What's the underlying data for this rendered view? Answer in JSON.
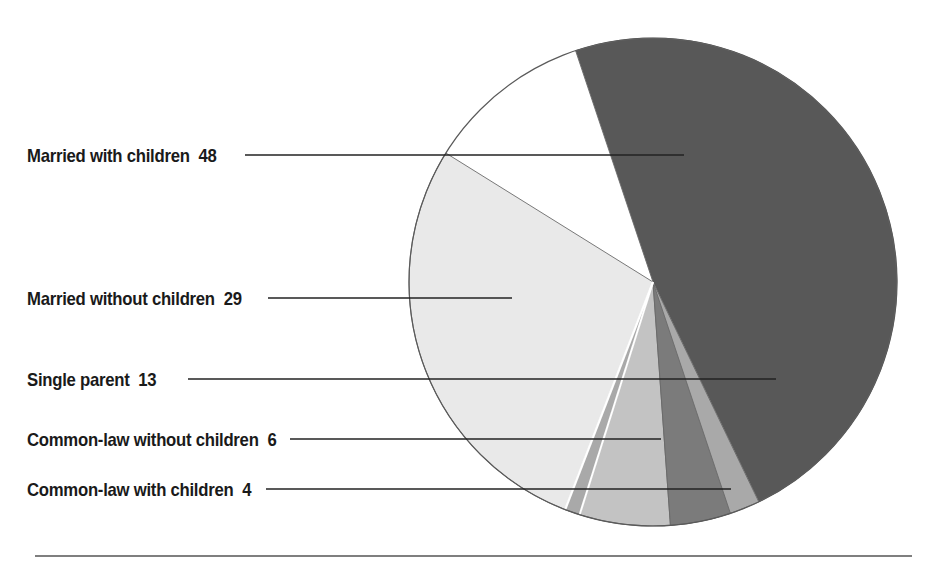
{
  "chart_data": {
    "type": "pie",
    "title": "",
    "subtitle": "",
    "xlabel": "",
    "ylabel": "",
    "legend_position": "left-callout-labels",
    "grid": false,
    "units": "percent",
    "total": 100,
    "categories": [
      "Married with children",
      "Married without children",
      "Single parent",
      "Common-law without children",
      "Common-law with children"
    ],
    "values": [
      48,
      29,
      13,
      6,
      4
    ],
    "slices": [
      {
        "label": "Married with children",
        "value": 48,
        "value_text": "48",
        "color": "#585858",
        "start_angle": 341.5,
        "sweep": 172.8
      },
      {
        "label": "Married without children",
        "value": 29,
        "value_text": "29",
        "color": "#e9e9e9",
        "start_angle": 197.5,
        "sweep": 104.4
      },
      {
        "label": "Single parent",
        "value": 13,
        "value_text": "13",
        "color": "#a9a9a9",
        "start_angle": 154.3,
        "sweep": 46.8
      },
      {
        "label": "Common-law without children",
        "value": 6,
        "value_text": "6",
        "color": "#c3c3c3",
        "start_angle": 175.9,
        "sweep": 21.6
      },
      {
        "label": "Common-law with children",
        "value": 4,
        "value_text": "4",
        "color": "#7b7b7b",
        "start_angle": 161.5,
        "sweep": 14.4
      }
    ]
  },
  "labels": [
    {
      "text": "Married with children",
      "value": "48"
    },
    {
      "text": "Married without children",
      "value": "29"
    },
    {
      "text": "Single parent",
      "value": "13"
    },
    {
      "text": "Common-law without children",
      "value": "6"
    },
    {
      "text": "Common-law with children",
      "value": "4"
    }
  ],
  "colors": {
    "married_with_children": "#585858",
    "married_without_children": "#e9e9e9",
    "single_parent": "#a9a9a9",
    "common_law_without_children": "#c3c3c3",
    "common_law_with_children": "#7b7b7b",
    "outline": "#4a4a4a",
    "leader_line": "#2b2b2b",
    "rule": "#555555",
    "background": "#ffffff"
  }
}
